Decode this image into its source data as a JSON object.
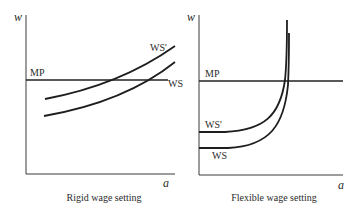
{
  "panels": [
    {
      "id": "rigid",
      "title": "Rigid wage setting",
      "y_axis_label": "w",
      "x_axis_label": "a",
      "lines": [
        {
          "name": "MP",
          "label": "MP",
          "type": "horizontal"
        },
        {
          "name": "WS'",
          "label": "WS'",
          "type": "increasing-convex"
        },
        {
          "name": "WS",
          "label": "WS",
          "type": "increasing-convex"
        }
      ]
    },
    {
      "id": "flexible",
      "title": "Flexible wage setting",
      "y_axis_label": "w",
      "x_axis_label": "a",
      "lines": [
        {
          "name": "MP",
          "label": "MP",
          "type": "horizontal"
        },
        {
          "name": "WS'",
          "label": "WS'",
          "type": "flat-then-vertical"
        },
        {
          "name": "WS",
          "label": "WS",
          "type": "flat-then-vertical"
        }
      ]
    }
  ],
  "colors": {
    "background": "#ffffff",
    "lines": "#1e1e1e",
    "axis": "#3a3a3a",
    "text": "#2a2a2a"
  }
}
